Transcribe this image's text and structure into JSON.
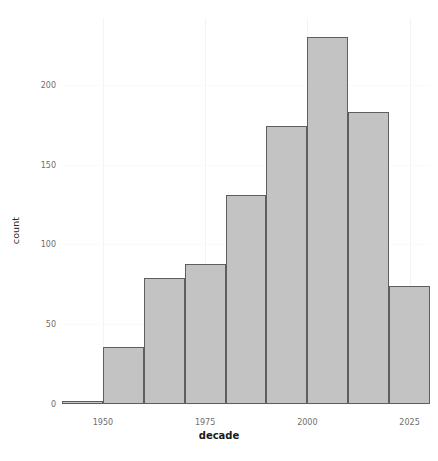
{
  "chart_data": {
    "type": "bar",
    "title": "",
    "subtitle": "",
    "xlabel": "decade",
    "ylabel": "count",
    "x_is_continuous": true,
    "bin_width": 10,
    "categories": [
      "1940",
      "1950",
      "1960",
      "1970",
      "1980",
      "1990",
      "2000",
      "2010",
      "2020"
    ],
    "bin_starts": [
      1940,
      1950,
      1960,
      1970,
      1980,
      1990,
      2000,
      2010,
      2020
    ],
    "bin_ends": [
      1950,
      1960,
      1970,
      1980,
      1990,
      2000,
      2010,
      2020,
      2030
    ],
    "values": [
      2,
      36,
      79,
      88,
      131,
      174,
      230,
      183,
      74
    ],
    "xlim": [
      1940,
      2030
    ],
    "ylim": [
      0,
      242
    ],
    "x_ticks": [
      1950,
      1975,
      2000,
      2025
    ],
    "x_tick_labels": [
      "1950",
      "1975",
      "2000",
      "2025"
    ],
    "y_ticks": [
      0,
      50,
      100,
      150,
      200
    ],
    "y_tick_labels": [
      "0",
      "50",
      "100",
      "150",
      "200"
    ],
    "grid": true,
    "legend": null,
    "legend_position": "none",
    "bar_fill_color": "#c3c3c3",
    "bar_border_color": "#5e5e5e",
    "panel_background": "#ffffff",
    "grid_color": "#f2f0f0",
    "tick_label_color": "#6e6e6e",
    "axis_title_color": "#1a1a1a"
  }
}
